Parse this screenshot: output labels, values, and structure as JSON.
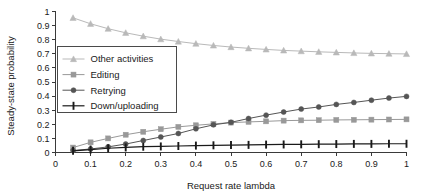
{
  "chart_data": {
    "type": "line",
    "title": "",
    "xlabel": "Request rate lambda",
    "ylabel": "Steady-state probability",
    "xlim": [
      0,
      1
    ],
    "ylim": [
      0,
      1
    ],
    "grid": false,
    "legend_position": "upper-left-inside",
    "xticks": [
      "0",
      "0.1",
      "0.2",
      "0.3",
      "0.4",
      "0.5",
      "0.6",
      "0.7",
      "0.8",
      "0.9",
      "1"
    ],
    "xtick_values": [
      0,
      0.1,
      0.2,
      0.3,
      0.4,
      0.5,
      0.6,
      0.7,
      0.8,
      0.9,
      1
    ],
    "yticks": [
      "0",
      "0.1",
      "0.2",
      "0.3",
      "0.4",
      "0.5",
      "0.6",
      "0.7",
      "0.8",
      "0.9",
      "1"
    ],
    "ytick_values": [
      0,
      0.1,
      0.2,
      0.3,
      0.4,
      0.5,
      0.6,
      0.7,
      0.8,
      0.9,
      1
    ],
    "x": [
      0.05,
      0.1,
      0.15,
      0.2,
      0.25,
      0.3,
      0.35,
      0.4,
      0.45,
      0.5,
      0.55,
      0.6,
      0.65,
      0.7,
      0.75,
      0.8,
      0.85,
      0.9,
      0.95,
      1
    ],
    "series": [
      {
        "name": "Other activities",
        "marker": "triangle",
        "color": "#b9b9b9",
        "values": [
          0.955,
          0.913,
          0.878,
          0.849,
          0.825,
          0.804,
          0.787,
          0.772,
          0.759,
          0.748,
          0.739,
          0.731,
          0.724,
          0.719,
          0.714,
          0.71,
          0.706,
          0.703,
          0.701,
          0.699
        ]
      },
      {
        "name": "Editing",
        "marker": "square",
        "color": "#999999",
        "values": [
          0.035,
          0.072,
          0.1,
          0.126,
          0.147,
          0.165,
          0.182,
          0.193,
          0.203,
          0.212,
          0.217,
          0.221,
          0.226,
          0.228,
          0.229,
          0.231,
          0.232,
          0.233,
          0.234,
          0.235
        ]
      },
      {
        "name": "Retrying",
        "marker": "circle",
        "color": "#555555",
        "values": [
          0.014,
          0.025,
          0.04,
          0.06,
          0.085,
          0.11,
          0.135,
          0.168,
          0.196,
          0.214,
          0.241,
          0.265,
          0.287,
          0.308,
          0.323,
          0.341,
          0.355,
          0.371,
          0.386,
          0.398
        ]
      },
      {
        "name": "Down/uploading",
        "marker": "bar",
        "color": "#1a1a1a",
        "values": [
          0.012,
          0.021,
          0.03,
          0.036,
          0.041,
          0.043,
          0.046,
          0.049,
          0.051,
          0.053,
          0.054,
          0.056,
          0.057,
          0.058,
          0.059,
          0.06,
          0.061,
          0.061,
          0.062,
          0.062
        ]
      }
    ]
  },
  "legend": {
    "items": [
      {
        "label": "Other activities"
      },
      {
        "label": "Editing"
      },
      {
        "label": "Retrying"
      },
      {
        "label": "Down/uploading"
      }
    ]
  }
}
